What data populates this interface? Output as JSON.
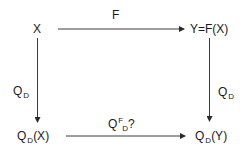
{
  "diagram": {
    "type": "commutative-diagram",
    "nodes": {
      "top_left": {
        "text": "X"
      },
      "top_right": {
        "text": "Y=F(X)"
      },
      "bottom_left": {
        "base": "Q",
        "sub": "D",
        "tail": "(X)"
      },
      "bottom_right": {
        "base": "Q",
        "sub": "D",
        "tail": "(Y)"
      }
    },
    "edges": {
      "top": {
        "label": "F",
        "from": "X",
        "to": "Y=F(X)"
      },
      "left": {
        "base": "Q",
        "sub": "D",
        "from": "X",
        "to": "Q_D(X)"
      },
      "right": {
        "base": "Q",
        "sub": "D",
        "from": "Y=F(X)",
        "to": "Q_D(Y)"
      },
      "bottom": {
        "base": "Q",
        "sup": "F",
        "sub": "D",
        "tail": "?",
        "from": "Q_D(X)",
        "to": "Q_D(Y)"
      }
    },
    "colors": {
      "line": "#3a3a3a",
      "text": "#1a1a1a",
      "background": "#ffffff"
    }
  }
}
